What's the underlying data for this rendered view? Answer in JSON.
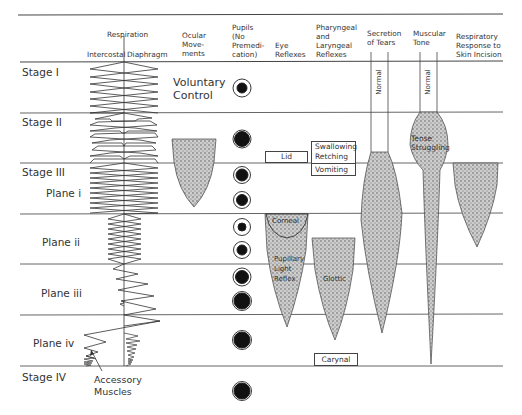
{
  "headers": {
    "respiration": "Respiration",
    "intercostal": "Intercostal",
    "diaphragm": "Diaphragm",
    "ocular": [
      "Ocular",
      "Move-",
      "ments"
    ],
    "pupils": [
      "Pupils",
      "(No",
      "Premedi-",
      "cation)"
    ],
    "eye_reflexes": [
      "Eye",
      "Reflexes"
    ],
    "pharyngeal": [
      "Pharyngeal",
      "and",
      "Laryngeal",
      "Reflexes"
    ],
    "tears": [
      "Secretion",
      "of Tears"
    ],
    "muscular": [
      "Muscular",
      "Tone"
    ],
    "respiratory_response": [
      "Respiratory",
      "Response to",
      "Skin Incision"
    ]
  },
  "stages": [
    {
      "label": "Stage I"
    },
    {
      "label": "Stage II"
    },
    {
      "label": "Stage III"
    },
    {
      "label": "Plane i"
    },
    {
      "label": "Plane ii"
    },
    {
      "label": "Plane iii"
    },
    {
      "label": "Plane iv"
    },
    {
      "label": "Stage IV"
    }
  ],
  "annotations": {
    "voluntary_control": [
      "Voluntary",
      "Control"
    ],
    "accessory_muscles": [
      "Accessory",
      "Muscles"
    ],
    "normal_tears": "Normal",
    "normal_tone": "Normal",
    "tense_struggling": [
      "Tense",
      "Struggling"
    ],
    "lid": "Lid",
    "swallowing": "Swallowing",
    "retching": "Retching",
    "vomiting": "Vomiting",
    "corneal": "Corneal",
    "pupillary": [
      "Pupillary",
      "Light",
      "Reflex"
    ],
    "glottic": "Glottic",
    "carynal": "Carynal"
  }
}
